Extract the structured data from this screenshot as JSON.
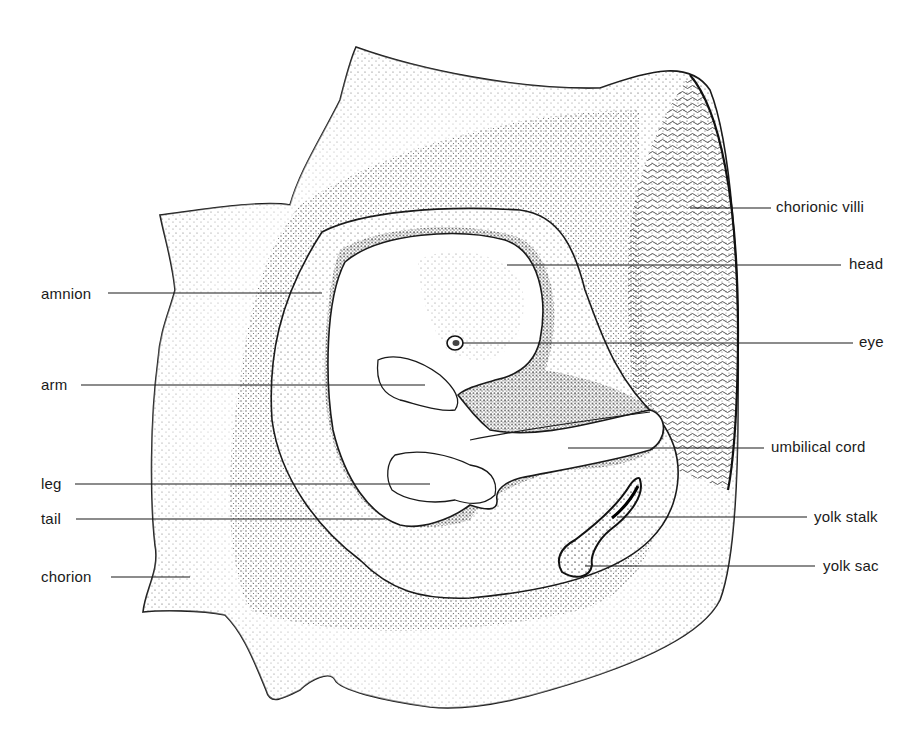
{
  "figure": {
    "ink_color": "#1a1a1a",
    "background": "#ffffff"
  },
  "labels": {
    "left": [
      {
        "id": "amnion",
        "text": "amnion",
        "x": 41,
        "y": 285,
        "line": [
          108,
          293,
          322,
          293
        ]
      },
      {
        "id": "arm",
        "text": "arm",
        "x": 41,
        "y": 376,
        "line": [
          81,
          385,
          425,
          385
        ]
      },
      {
        "id": "leg",
        "text": "leg",
        "x": 41,
        "y": 475,
        "line": [
          75,
          484,
          430,
          484
        ]
      },
      {
        "id": "tail",
        "text": "tail",
        "x": 41,
        "y": 510,
        "line": [
          76,
          519,
          385,
          519
        ]
      },
      {
        "id": "chorion",
        "text": "chorion",
        "x": 41,
        "y": 568,
        "line": [
          111,
          577,
          190,
          577
        ]
      }
    ],
    "right": [
      {
        "id": "chorionic-villi",
        "text": "chorionic villi",
        "x": 776,
        "y": 198,
        "line": [
          690,
          208,
          771,
          208
        ]
      },
      {
        "id": "head",
        "text": "head",
        "x": 849,
        "y": 255,
        "line": [
          507,
          265,
          841,
          265
        ]
      },
      {
        "id": "eye",
        "text": "eye",
        "x": 859,
        "y": 333,
        "line": [
          462,
          343,
          853,
          343
        ]
      },
      {
        "id": "umbilical-cord",
        "text": "umbilical cord",
        "x": 771,
        "y": 438,
        "line": [
          568,
          448,
          764,
          448
        ]
      },
      {
        "id": "yolk-stalk",
        "text": "yolk stalk",
        "x": 814,
        "y": 508,
        "line": [
          617,
          517,
          807,
          517
        ]
      },
      {
        "id": "yolk-sac",
        "text": "yolk sac",
        "x": 823,
        "y": 557,
        "line": [
          585,
          566,
          815,
          566
        ]
      }
    ]
  }
}
